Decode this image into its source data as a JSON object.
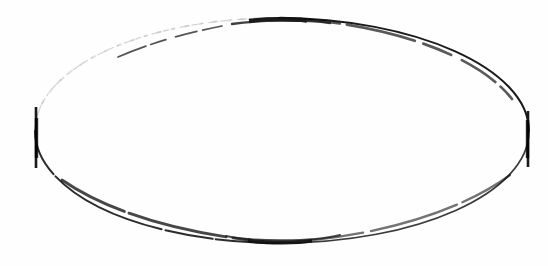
{
  "figure": {
    "type": "geometric-line-drawing",
    "title": "",
    "caption": "",
    "background_color": "#fefefe",
    "ink_color": "#1a1a1a",
    "faint_ink_color": "#9a9a9a",
    "mid_ink_color": "#4a4a4a",
    "canvas": {
      "width": 548,
      "height": 266
    },
    "ellipse": {
      "center_x": 282,
      "center_y": 131,
      "semi_major_axis_x": 247,
      "semi_minor_axis_y": 113,
      "left_vertex_x": 35,
      "right_vertex_x": 529,
      "top_apex_x": 278,
      "top_apex_y": 18,
      "bottom_nadir_x": 280,
      "bottom_nadir_y": 243,
      "stroke_width_nominal": 1.6
    },
    "vertex_ticks": [
      {
        "name": "left-vertex-tick",
        "x": 36,
        "y_top": 107,
        "y_bottom": 168,
        "length": 61,
        "stroke_width": 2.6,
        "color": "#1a1a1a"
      },
      {
        "name": "right-vertex-tick",
        "x": 528,
        "y_top": 111,
        "y_bottom": 167,
        "length": 56,
        "stroke_width": 2.6,
        "color": "#1a1a1a"
      }
    ],
    "ink_blobs": [
      {
        "name": "top-apex-blob",
        "x_start": 249,
        "x_end": 307,
        "y": 20,
        "thickness": 4.4,
        "color": "#111111"
      },
      {
        "name": "bottom-nadir-blob",
        "x_start": 248,
        "x_end": 312,
        "y": 241,
        "thickness": 4.0,
        "color": "#111111"
      }
    ],
    "arc_segments": [
      {
        "name": "upper-left-arc",
        "quadrant": "upper-left",
        "rendering": "faint-broken",
        "opacity": 0.42,
        "stroke_width": 1.3,
        "dash_pattern": "5 4 2 6 9 3"
      },
      {
        "name": "upper-right-arc",
        "quadrant": "upper-right",
        "rendering": "solid-dark",
        "opacity": 1.0,
        "stroke_width": 2.0,
        "dash_pattern": "none"
      },
      {
        "name": "lower-left-arc",
        "quadrant": "lower-left",
        "rendering": "solid-dark-slight-gaps",
        "opacity": 0.92,
        "stroke_width": 2.0,
        "dash_pattern": "48 3 120 4"
      },
      {
        "name": "lower-right-arc",
        "quadrant": "lower-right",
        "rendering": "solid-medium",
        "opacity": 0.88,
        "stroke_width": 1.7,
        "dash_pattern": "none"
      }
    ],
    "labels": [],
    "annotations": []
  }
}
